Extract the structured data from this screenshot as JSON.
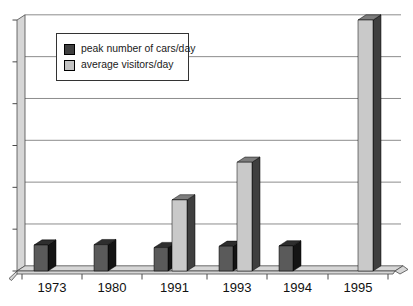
{
  "chart_data": {
    "type": "bar",
    "style": "3d-column",
    "title": "",
    "xlabel": "",
    "ylabel": "",
    "categories": [
      "1973",
      "1980",
      "1991",
      "1993",
      "1994",
      "1995"
    ],
    "series": [
      {
        "name": "peak number of cars/day",
        "legend_swatch": "#3f3f3f",
        "color_front": "#5a5a5a",
        "color_top": "#2e2e2e",
        "color_side": "#141414",
        "values": [
          0.62,
          0.63,
          0.56,
          0.59,
          0.6,
          null
        ]
      },
      {
        "name": "average visitors/day",
        "legend_swatch": "#c3c3c3",
        "color_front": "#c9c9c9",
        "color_top": "#7d7d7d",
        "color_side": "#3f3f3f",
        "values": [
          null,
          null,
          1.7,
          2.6,
          null,
          6.0
        ]
      }
    ],
    "value_axis": {
      "min": 0,
      "max": 6,
      "tick_count": 7,
      "tick_labels_visible": false,
      "note": "y-axis has tick marks but no numeric labels; values estimated in gridline units"
    },
    "grid": true,
    "legend_position": "top-left-inside",
    "colors": {
      "wall": "#d6d6d6",
      "wall_edge": "#4a4a4a",
      "gridline": "#8c8c8c",
      "bar_outline": "#000000",
      "text": "#111111",
      "background": "#ffffff",
      "legend_border": "#333333",
      "legend_background": "#ffffff"
    }
  }
}
